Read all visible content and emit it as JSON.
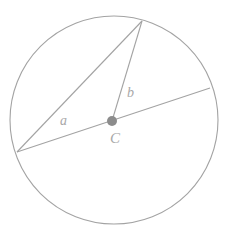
{
  "figure": {
    "background_color": "#ffffff",
    "stroke_color": "#a3a3a3",
    "label_color": "#a8a8a8",
    "center_dot_color": "#8c8c8c",
    "circle": {
      "cx": 114,
      "cy": 120,
      "r": 104,
      "stroke_width": 1.1
    },
    "center_point": {
      "name": "C",
      "x": 112,
      "y": 121,
      "radius": 5
    },
    "points": {
      "apex": {
        "x": 142,
        "y": 21
      },
      "left": {
        "x": 17,
        "y": 152
      },
      "diameter_right": {
        "x": 210,
        "y": 88
      }
    },
    "segments": [
      {
        "name": "diameter",
        "from": "left",
        "to": "diameter_right"
      },
      {
        "name": "chord-a",
        "from": "left",
        "to": "apex"
      },
      {
        "name": "radius-b",
        "from": "center",
        "to": "apex"
      }
    ],
    "labels": {
      "a": "a",
      "b": "b",
      "center": "C"
    }
  }
}
